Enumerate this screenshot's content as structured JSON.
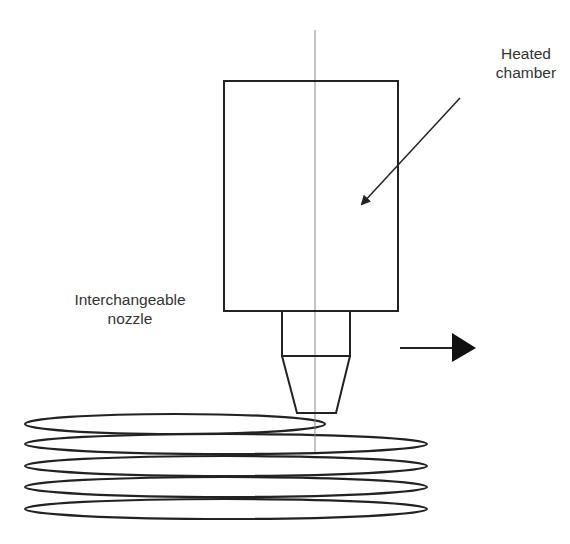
{
  "diagram": {
    "labels": {
      "heated_chamber": {
        "line1": "Heated",
        "line2": "chamber"
      },
      "interchangeable_nozzle": {
        "line1": "Interchangeable",
        "line2": "nozzle"
      }
    },
    "components": [
      "heated-chamber",
      "interchangeable-nozzle",
      "central-axis",
      "movement-arrow",
      "deposited-filament-layers"
    ],
    "filament_layers_count": 5,
    "movement_direction": "right",
    "colors": {
      "stroke": "#222222",
      "axis": "#888888",
      "text": "#333333",
      "background": "#ffffff"
    }
  }
}
